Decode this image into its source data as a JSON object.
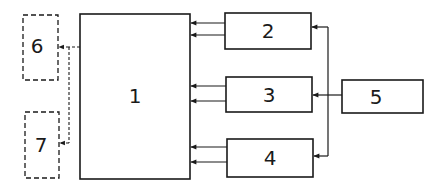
{
  "diagram": {
    "type": "block-diagram",
    "colors": {
      "stroke": "#1a1a1a",
      "background": "#ffffff"
    },
    "blocks": [
      {
        "id": "1",
        "label": "1",
        "style": "solid"
      },
      {
        "id": "2",
        "label": "2",
        "style": "solid"
      },
      {
        "id": "3",
        "label": "3",
        "style": "solid"
      },
      {
        "id": "4",
        "label": "4",
        "style": "solid"
      },
      {
        "id": "5",
        "label": "5",
        "style": "solid"
      },
      {
        "id": "6",
        "label": "6",
        "style": "dashed"
      },
      {
        "id": "7",
        "label": "7",
        "style": "dashed"
      }
    ],
    "connections": [
      {
        "from": "2",
        "to": "1",
        "count": 2,
        "style": "solid",
        "arrow": "to"
      },
      {
        "from": "3",
        "to": "1",
        "count": 2,
        "style": "solid",
        "arrow": "to"
      },
      {
        "from": "4",
        "to": "1",
        "count": 2,
        "style": "solid",
        "arrow": "to"
      },
      {
        "from": "5",
        "to": "2",
        "count": 1,
        "style": "solid",
        "arrow": "to"
      },
      {
        "from": "5",
        "to": "3",
        "count": 1,
        "style": "solid",
        "arrow": "to"
      },
      {
        "from": "5",
        "to": "4",
        "count": 1,
        "style": "solid",
        "arrow": "to"
      },
      {
        "from": "1",
        "to": "6",
        "count": 1,
        "style": "dashed",
        "arrow": "to"
      },
      {
        "from": "1",
        "to": "7",
        "count": 1,
        "style": "dashed",
        "arrow": "to"
      }
    ]
  }
}
